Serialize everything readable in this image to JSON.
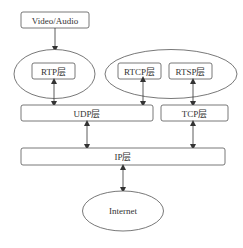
{
  "diagram": {
    "nodes": {
      "source": {
        "label": "Video/Audio"
      },
      "rtp": {
        "label": "RTP层"
      },
      "rtcp": {
        "label": "RTCP层"
      },
      "rtsp": {
        "label": "RTSP层"
      },
      "udp": {
        "label": "UDP层"
      },
      "tcp": {
        "label": "TCP层"
      },
      "ip": {
        "label": "IP层"
      },
      "internet": {
        "label": "Internet"
      }
    },
    "edges": [
      {
        "from": "Video/Audio",
        "to": "RTP层",
        "direction": "one-way"
      },
      {
        "from": "RTP层",
        "to": "UDP层",
        "direction": "two-way"
      },
      {
        "from": "RTCP层",
        "to": "UDP层",
        "direction": "two-way"
      },
      {
        "from": "RTSP层",
        "to": "TCP层",
        "direction": "two-way"
      },
      {
        "from": "UDP层",
        "to": "IP层",
        "direction": "two-way"
      },
      {
        "from": "TCP层",
        "to": "IP层",
        "direction": "two-way"
      },
      {
        "from": "IP层",
        "to": "Internet",
        "direction": "two-way"
      }
    ],
    "colors": {
      "stroke": "#555555",
      "text": "#333333",
      "background": "#ffffff"
    }
  }
}
